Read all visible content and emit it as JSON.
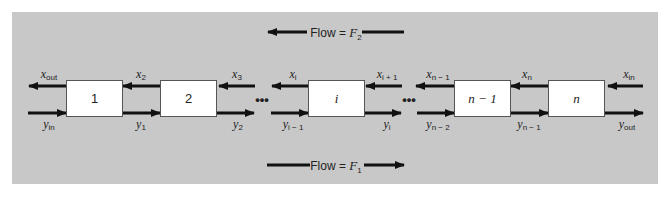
{
  "diagram": {
    "colors": {
      "panel": "#c8c8c8",
      "box_fill": "#ffffff",
      "box_border": "#555555",
      "arrow": "#111111"
    },
    "flow_top": {
      "prefix": "Flow = ",
      "var": "F",
      "sub": "2",
      "direction": "left"
    },
    "flow_bottom": {
      "prefix": "Flow = ",
      "var": "F",
      "sub": "1",
      "direction": "right"
    },
    "stages": [
      {
        "label": "1",
        "italic": false
      },
      {
        "label": "2",
        "italic": false
      },
      {
        "label": "i",
        "italic": true
      },
      {
        "label": "n − 1",
        "italic": true
      },
      {
        "label": "n",
        "italic": true
      }
    ],
    "ellipsis": "•••",
    "x_streams": [
      {
        "var": "x",
        "sub": "out"
      },
      {
        "var": "x",
        "sub": "2"
      },
      {
        "var": "x",
        "sub": "3"
      },
      {
        "var": "x",
        "sub": "i"
      },
      {
        "var": "x",
        "sub": "i + 1"
      },
      {
        "var": "x",
        "sub": "n − 1"
      },
      {
        "var": "x",
        "sub": "n"
      },
      {
        "var": "x",
        "sub": "in"
      }
    ],
    "y_streams": [
      {
        "var": "y",
        "sub": "in"
      },
      {
        "var": "y",
        "sub": "1"
      },
      {
        "var": "y",
        "sub": "2"
      },
      {
        "var": "y",
        "sub": "i − 1"
      },
      {
        "var": "y",
        "sub": "i"
      },
      {
        "var": "y",
        "sub": "n − 2"
      },
      {
        "var": "y",
        "sub": "n − 1"
      },
      {
        "var": "y",
        "sub": "out"
      }
    ]
  }
}
